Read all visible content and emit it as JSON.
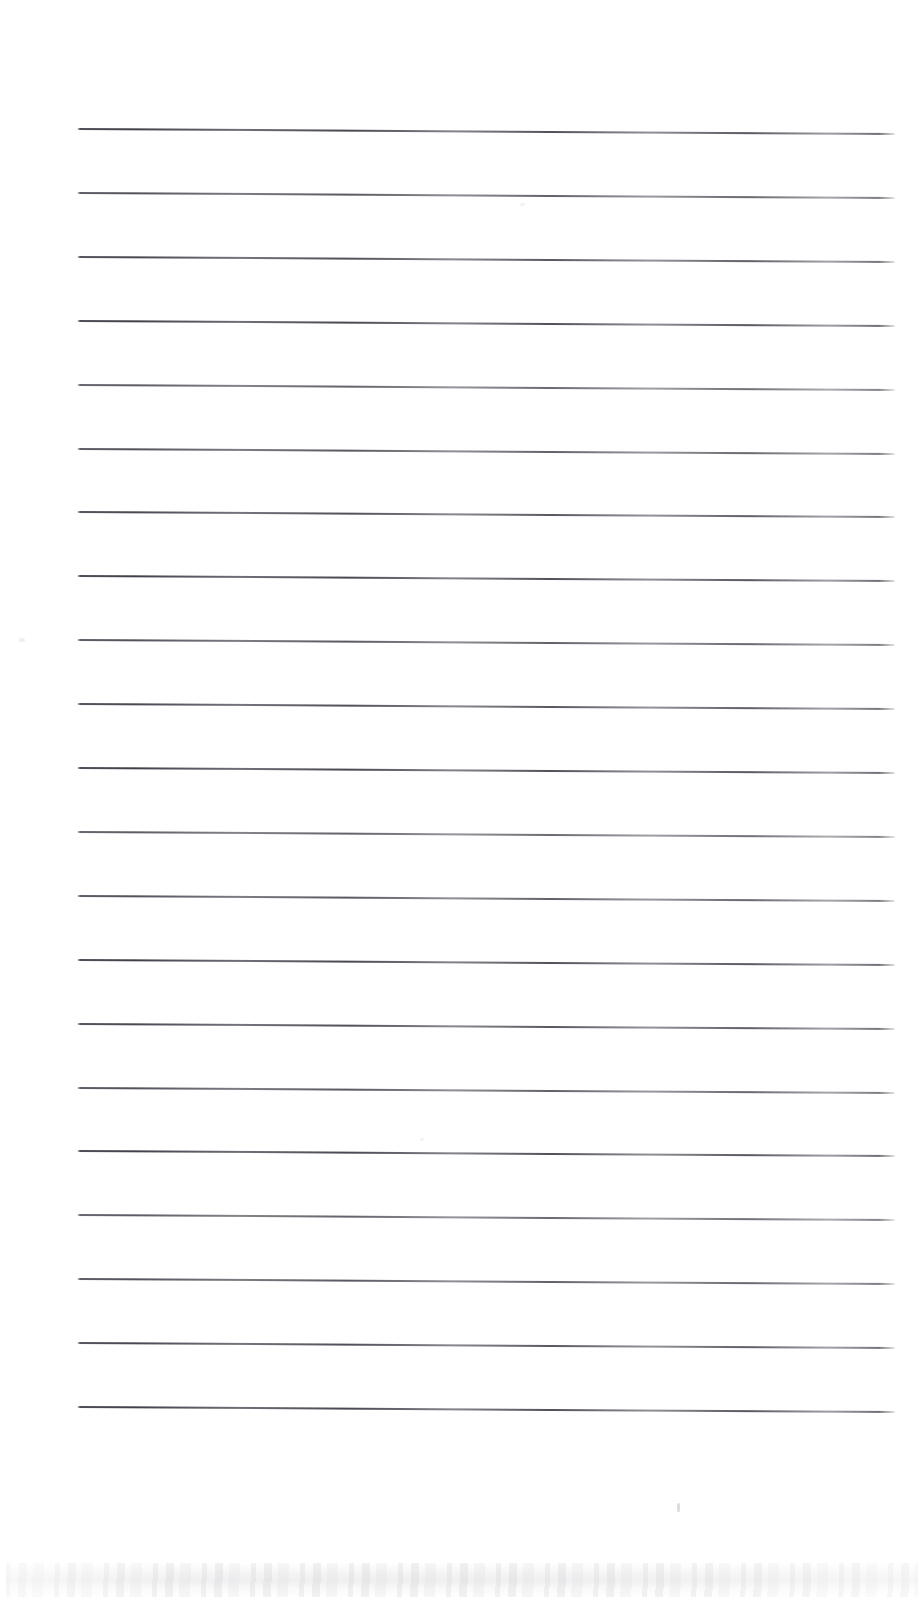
{
  "document": {
    "kind": "scanned-lined-paper",
    "title": "Blank Ruled Notebook Page",
    "page_width": 924,
    "page_height": 1624,
    "background_color": "#fefefe",
    "text_content": "",
    "has_handwriting": false,
    "has_printed_text": false
  },
  "ruling": {
    "line_count": 21,
    "line_color": "#3a3a44",
    "line_thickness_px": 1.7,
    "left_x": 77,
    "right_x": 895,
    "first_line_y_left": 128,
    "line_spacing_px": 63.9,
    "slope_drop_px": 5,
    "left_margin_rule": false,
    "lines": [
      {
        "index": 1,
        "y_left": 128,
        "y_right": 133,
        "tone": "v1"
      },
      {
        "index": 2,
        "y_left": 191.9,
        "y_right": 196.9,
        "tone": "v2"
      },
      {
        "index": 3,
        "y_left": 255.8,
        "y_right": 260.8,
        "tone": "v3"
      },
      {
        "index": 4,
        "y_left": 319.7,
        "y_right": 324.7,
        "tone": "v1"
      },
      {
        "index": 5,
        "y_left": 383.6,
        "y_right": 388.6,
        "tone": "v4"
      },
      {
        "index": 6,
        "y_left": 447.5,
        "y_right": 452.5,
        "tone": "v2"
      },
      {
        "index": 7,
        "y_left": 511.4,
        "y_right": 516.4,
        "tone": "v3"
      },
      {
        "index": 8,
        "y_left": 575.3,
        "y_right": 580.3,
        "tone": "v1"
      },
      {
        "index": 9,
        "y_left": 639.2,
        "y_right": 644.2,
        "tone": "v2"
      },
      {
        "index": 10,
        "y_left": 703.1,
        "y_right": 708.1,
        "tone": "v3"
      },
      {
        "index": 11,
        "y_left": 767.0,
        "y_right": 772.0,
        "tone": "v1"
      },
      {
        "index": 12,
        "y_left": 830.9,
        "y_right": 835.9,
        "tone": "v4"
      },
      {
        "index": 13,
        "y_left": 894.8,
        "y_right": 899.8,
        "tone": "v2"
      },
      {
        "index": 14,
        "y_left": 958.7,
        "y_right": 963.7,
        "tone": "v1"
      },
      {
        "index": 15,
        "y_left": 1022.6,
        "y_right": 1027.6,
        "tone": "v3"
      },
      {
        "index": 16,
        "y_left": 1086.5,
        "y_right": 1091.5,
        "tone": "v2"
      },
      {
        "index": 17,
        "y_left": 1150.4,
        "y_right": 1155.4,
        "tone": "v1"
      },
      {
        "index": 18,
        "y_left": 1214.3,
        "y_right": 1219.3,
        "tone": "v4"
      },
      {
        "index": 19,
        "y_left": 1278.2,
        "y_right": 1283.2,
        "tone": "v2"
      },
      {
        "index": 20,
        "y_left": 1342.1,
        "y_right": 1347.1,
        "tone": "v3"
      },
      {
        "index": 21,
        "y_left": 1406.0,
        "y_right": 1411.0,
        "tone": "v1"
      }
    ]
  },
  "margins": {
    "top_blank_px": 128,
    "bottom_blank_px": 218,
    "left_blank_px": 77,
    "right_blank_px": 29
  },
  "artifacts": {
    "smudge_band": {
      "label": "scanner edge smudge band",
      "x": 6,
      "y": 1563,
      "width": 912,
      "height": 34,
      "color": "#b0b0b4"
    },
    "specks": [
      {
        "name": "speck-mid-right",
        "x": 677,
        "y": 1503,
        "width": 3,
        "height": 9
      },
      {
        "name": "speck-left-margin",
        "x": 19,
        "y": 638,
        "width": 6,
        "height": 4
      },
      {
        "name": "speck-upper-mid",
        "x": 520,
        "y": 203,
        "width": 5,
        "height": 3
      },
      {
        "name": "speck-lower-mid",
        "x": 420,
        "y": 1138,
        "width": 4,
        "height": 3
      }
    ]
  }
}
